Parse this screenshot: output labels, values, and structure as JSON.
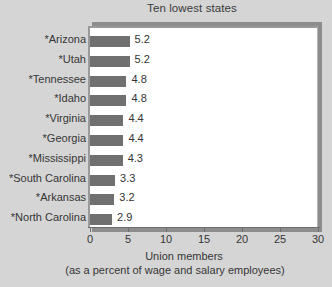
{
  "chart_data": {
    "type": "bar",
    "orientation": "horizontal",
    "title": "Ten lowest states",
    "xlabel": "Union members",
    "xlabel_sub": "(as a percent of wage and salary employees)",
    "ylabel": "",
    "xlim": [
      0,
      30
    ],
    "xticks": [
      "0",
      "5",
      "10",
      "15",
      "20",
      "25",
      "30"
    ],
    "xtick_values": [
      0,
      5,
      10,
      15,
      20,
      25,
      30
    ],
    "grid": false,
    "legend": false,
    "categories": [
      "*Arizona",
      "*Utah",
      "*Tennessee",
      "*Idaho",
      "*Virginia",
      "*Georgia",
      "*Mississippi",
      "*South Carolina",
      "*Arkansas",
      "*North Carolina"
    ],
    "values": [
      5.2,
      5.2,
      4.8,
      4.8,
      4.4,
      4.4,
      4.3,
      3.3,
      3.2,
      2.9
    ],
    "value_labels": [
      "5.2",
      "5.2",
      "4.8",
      "4.8",
      "4.4",
      "4.4",
      "4.3",
      "3.3",
      "3.2",
      "2.9"
    ],
    "bar_color": "#707070",
    "plot_background": "#ffffff",
    "figure_background": "#d5d5d5",
    "text_color": "#353535"
  }
}
